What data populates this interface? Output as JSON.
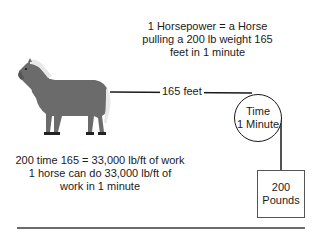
{
  "title": {
    "lines": [
      "1 Horsepower = a Horse",
      "pulling a 200 lb weight 165",
      "feet in 1 minute"
    ]
  },
  "rope": {
    "distance_label": "165 feet"
  },
  "pulley": {
    "line1": "Time",
    "line2": "1 Minute"
  },
  "weight": {
    "line1": "200",
    "line2": "Pounds"
  },
  "calculation": {
    "lines": [
      "200 time 165 = 33,000 lb/ft of work",
      "1 horse can do 33,000 lb/ft of",
      "work in 1 minute"
    ]
  },
  "illustration": {
    "subject": "horse-icon",
    "body_color": "#6b6b6b",
    "mane_color": "#e8e8e8"
  }
}
